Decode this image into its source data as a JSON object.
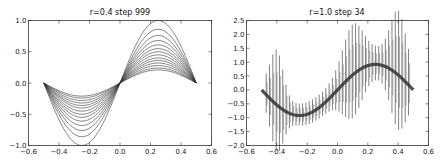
{
  "chart_data": [
    {
      "type": "line",
      "title": "r=0.4    step 999",
      "xlabel": "",
      "ylabel": "",
      "xlim": [
        -0.6,
        0.6
      ],
      "ylim": [
        -1.0,
        1.0
      ],
      "xticks": [
        "-0.6",
        "-0.4",
        "-0.2",
        "0.0",
        "0.2",
        "0.4",
        "0.6"
      ],
      "yticks": [
        "-1.0",
        "-0.5",
        "0.0",
        "0.5",
        "1.0"
      ],
      "grid": false,
      "legend": null,
      "description": "Family of sine curves y = A*sin(2*pi*x) on x in [-0.5, 0.5] with decreasing amplitudes",
      "series_amplitudes": [
        1.0,
        0.86,
        0.76,
        0.68,
        0.61,
        0.55,
        0.5,
        0.45,
        0.4,
        0.36,
        0.32,
        0.28,
        0.24,
        0.21
      ],
      "x_range": [
        -0.5,
        0.5
      ],
      "line_color": "#333333"
    },
    {
      "type": "line",
      "title": "r=1.0    step 34",
      "xlabel": "",
      "ylabel": "",
      "xlim": [
        -0.6,
        0.6
      ],
      "ylim": [
        -2.0,
        2.5
      ],
      "xticks": [
        "-0.6",
        "-0.4",
        "-0.2",
        "0.0",
        "0.2",
        "0.4",
        "0.6"
      ],
      "yticks": [
        "-2.0",
        "-1.5",
        "-1.0",
        "-0.5",
        "0.0",
        "0.5",
        "1.0",
        "1.5",
        "2.0",
        "2.5"
      ],
      "grid": false,
      "legend": null,
      "description": "Oscillating curves around y ≈ 0.9*sin(2*pi*x); high-frequency sawtooth oscillation with envelope peaks near x=-0.4 (~±1.7), x=0.1 (~2.1/-1.3), x=0.4 (~2.4/-1.6)",
      "mean_amplitude": 0.92,
      "x_range": [
        -0.5,
        0.5
      ],
      "oscillation_count": 44,
      "line_color": "#444444"
    }
  ]
}
